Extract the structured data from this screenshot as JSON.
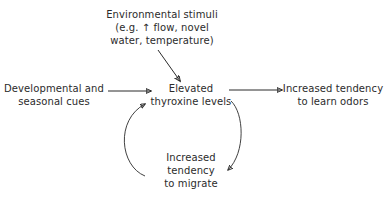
{
  "diagram": {
    "background_color": "#ffffff",
    "text_color": "#2b2b2b",
    "stroke_color": "#2b2b2b",
    "nodes": {
      "environmental_stimuli": "Environmental stimuli\n(e.g. ↑ flow, novel\nwater, temperature)",
      "developmental_cues": "Developmental and\nseasonal cues",
      "elevated_thyroxine": "Elevated\nthyroxine levels",
      "increased_odor_learning": "Increased tendency\nto learn odors",
      "increased_migration": "Increased\ntendency\nto migrate"
    },
    "edges": [
      {
        "name": "stimuli-to-thyroxine",
        "from": "environmental_stimuli",
        "to": "elevated_thyroxine",
        "style": "straight-diagonal"
      },
      {
        "name": "cues-to-thyroxine",
        "from": "developmental_cues",
        "to": "elevated_thyroxine",
        "style": "straight-horizontal"
      },
      {
        "name": "thyroxine-to-odors",
        "from": "elevated_thyroxine",
        "to": "increased_odor_learning",
        "style": "straight-horizontal"
      },
      {
        "name": "thyroxine-to-migration",
        "from": "elevated_thyroxine",
        "to": "increased_migration",
        "style": "curved-arc-right"
      },
      {
        "name": "migration-to-thyroxine",
        "from": "increased_migration",
        "to": "elevated_thyroxine",
        "style": "curved-arc-left"
      }
    ]
  }
}
